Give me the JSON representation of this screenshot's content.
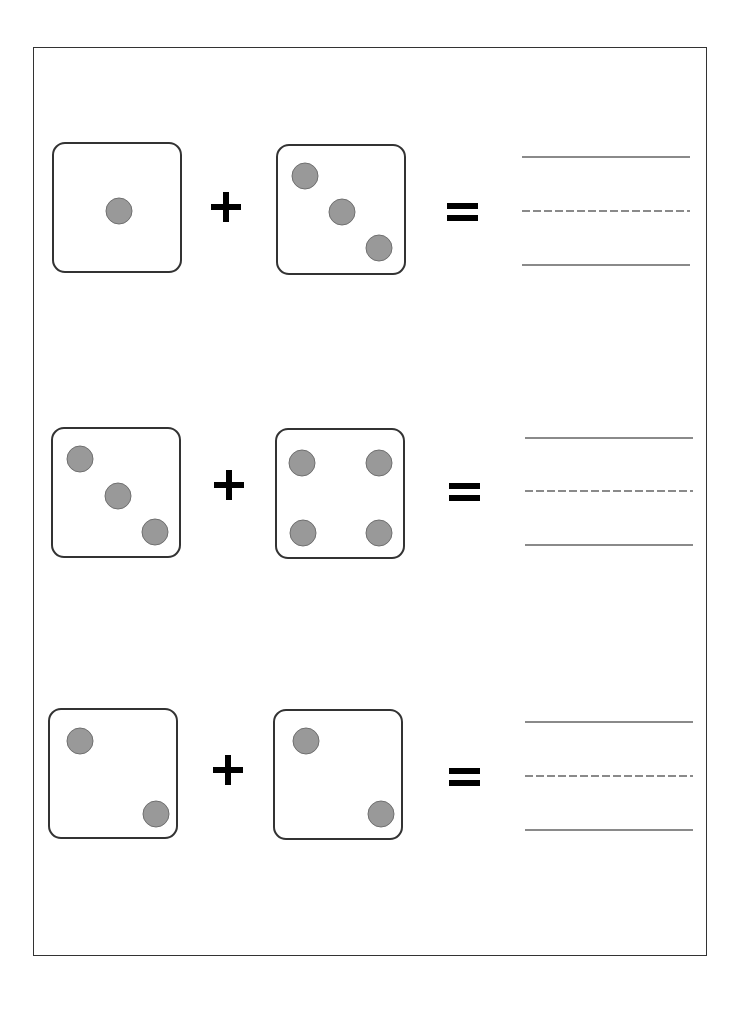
{
  "worksheet": {
    "title": "Dice Addition",
    "operator_plus": "+",
    "operator_equals": "=",
    "problems": [
      {
        "left_die": {
          "value": 1,
          "box": [
            52,
            142
          ],
          "pips": [
            [
              65,
              67
            ]
          ]
        },
        "right_die": {
          "value": 3,
          "box": [
            276,
            144
          ],
          "pips": [
            [
              27,
              30
            ],
            [
              64,
              66
            ],
            [
              101,
              102
            ]
          ]
        },
        "plus": [
          226,
          207
        ],
        "equals": [
          447,
          203
        ],
        "answer": "",
        "lines": {
          "x": 522,
          "top": 157,
          "mid": 211,
          "bottom": 265
        }
      },
      {
        "left_die": {
          "value": 3,
          "box": [
            51,
            427
          ],
          "pips": [
            [
              27,
              30
            ],
            [
              65,
              67
            ],
            [
              102,
              103
            ]
          ]
        },
        "right_die": {
          "value": 4,
          "box": [
            275,
            428
          ],
          "pips": [
            [
              25,
              33
            ],
            [
              102,
              33
            ],
            [
              26,
              103
            ],
            [
              102,
              103
            ]
          ]
        },
        "plus": [
          229,
          485
        ],
        "equals": [
          449,
          483
        ],
        "answer": "",
        "lines": {
          "x": 525,
          "top": 438,
          "mid": 491,
          "bottom": 545
        }
      },
      {
        "left_die": {
          "value": 2,
          "box": [
            48,
            708
          ],
          "pips": [
            [
              30,
              31
            ],
            [
              106,
              104
            ]
          ]
        },
        "right_die": {
          "value": 2,
          "box": [
            273,
            709
          ],
          "pips": [
            [
              31,
              30
            ],
            [
              106,
              103
            ]
          ]
        },
        "plus": [
          228,
          770
        ],
        "equals": [
          449,
          768
        ],
        "answer": "",
        "lines": {
          "x": 525,
          "top": 722,
          "mid": 776,
          "bottom": 830
        }
      }
    ]
  },
  "colors": {
    "die_border": "#333333",
    "pip_fill": "#999999",
    "pip_border": "#6f6f6f",
    "operator": "#000000",
    "answer_line": "#8a8a8a",
    "page_border": "#333333"
  }
}
